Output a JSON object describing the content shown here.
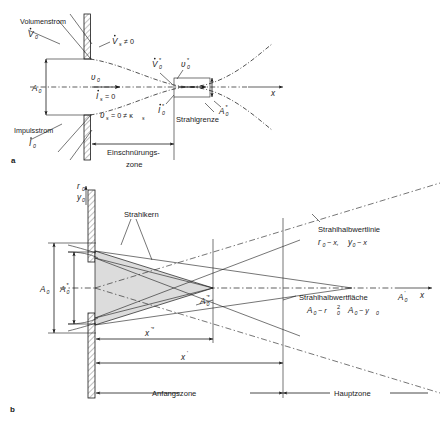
{
  "figure": {
    "panels": [
      {
        "id": "a",
        "letter": "a"
      },
      {
        "id": "b",
        "letter": "b"
      }
    ]
  },
  "panel_a": {
    "letter": "a",
    "labels": {
      "volumenstrom": "Volumenstrom",
      "volumenstrom_sym": "V",
      "volumenstrom_sub": "0",
      "impulsstrom": "Impulsstrom",
      "impulsstrom_sym": "I",
      "impulsstrom_sub": "0",
      "vs_sym": "V",
      "vs_sub": "s",
      "vs_rel": "≠ 0",
      "is_sym": "I",
      "is_sub": "s",
      "is_rel": "= 0",
      "vs0_star_sym": "V",
      "vs0_star_sub": "0",
      "vs0_star_sup": "*",
      "is0_star_sym": "I",
      "is0_star_sub": "0",
      "is0_star_sup": "*",
      "u0_sym": "υ",
      "u0_sub": "0",
      "u0star_sym": "υ",
      "u0star_sub": "0",
      "u0star_sup": "*",
      "a0_sym": "A",
      "a0_sub": "0",
      "a0star_sym": "A",
      "a0star_sub": "0",
      "a0star_sup": "*",
      "us_eq_sym": "υ",
      "us_eq_sub": "s",
      "us_eq_rest": "= 0 ≠ κ",
      "us_eq_sub2": "s",
      "strahlgrenze": "Strahlgrenze",
      "einschnuerungs": "Einschnürungs-",
      "zone": "zone",
      "x_axis": "x"
    }
  },
  "panel_b": {
    "letter": "b",
    "labels": {
      "r0_sym": "r",
      "r0_sub": "0",
      "y0_sym": "y",
      "y0_sub": "0",
      "a0_sym": "A",
      "a0_sub": "0",
      "a0star_sym": "A",
      "a0star_sub": "0",
      "a0star_sup": "*",
      "a0pstar_sym": "A",
      "a0pstar_sub": "0",
      "a0pstar_sup": "'*",
      "strahlkern": "Strahlkern",
      "halbwertlinie": "Strahlhalbwertlinie",
      "halbwertlinie_rel_1": "r",
      "halbwertlinie_rel_1sub": "0",
      "halbwertlinie_rel_1rest": "~ x,",
      "halbwertlinie_rel_2": "y",
      "halbwertlinie_rel_2sub": "0",
      "halbwertlinie_rel_2rest": "~ x",
      "halbwertflaeche": "Strahlhalbwertfläche",
      "halbwertflaeche_sym": "A",
      "halbwertflaeche_sub": "0",
      "halbwertflaeche_sup": "'",
      "flaeche_rel_1": "A",
      "flaeche_rel_1sub": "0",
      "flaeche_rel_1rest": "~ r",
      "flaeche_rel_1sub2": "0",
      "flaeche_rel_1sup2": "2",
      "flaeche_rel_2": "A",
      "flaeche_rel_2sub": "0",
      "flaeche_rel_2rest": "~ y",
      "flaeche_rel_2sub2": "0",
      "xstar_sym": "x",
      "xstar_sup": "'*",
      "xp_sym": "x",
      "xp_sup": "'",
      "anfangszone": "Anfangszone",
      "hauptzone": "Hauptzone",
      "x_axis": "x"
    }
  },
  "colors": {
    "ink": "#1a1a1a",
    "core_fill": "#dcdcdc",
    "background": "#ffffff"
  }
}
